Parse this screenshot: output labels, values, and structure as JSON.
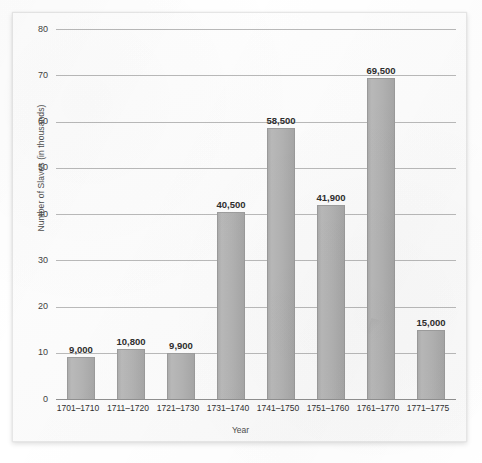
{
  "chart_data": {
    "type": "bar",
    "title": "",
    "xlabel": "Year",
    "ylabel": "Number of Slaves (in thousands)",
    "ylim": [
      0,
      80
    ],
    "ytick_labels": [
      "80",
      "70",
      "60",
      "50",
      "40",
      "30",
      "20",
      "10",
      "0"
    ],
    "ytick_values": [
      80,
      70,
      60,
      50,
      40,
      30,
      20,
      10,
      0
    ],
    "grid": true,
    "legend": "none",
    "categories": [
      "1701–1710",
      "1711–1720",
      "1721–1730",
      "1731–1740",
      "1741–1750",
      "1751–1760",
      "1761–1770",
      "1771–1775"
    ],
    "values": [
      9.0,
      10.8,
      9.9,
      40.5,
      58.5,
      41.9,
      69.5,
      15.0
    ],
    "value_labels": [
      "9,000",
      "10,800",
      "9,900",
      "40,500",
      "58,500",
      "41,900",
      "69,500",
      "15,000"
    ],
    "bars": [
      {
        "category": "1701–1710",
        "value": 9.0,
        "label": "9,000"
      },
      {
        "category": "1711–1720",
        "value": 10.8,
        "label": "10,800"
      },
      {
        "category": "1721–1730",
        "value": 9.9,
        "label": "9,900"
      },
      {
        "category": "1731–1740",
        "value": 40.5,
        "label": "40,500"
      },
      {
        "category": "1741–1750",
        "value": 58.5,
        "label": "58,500"
      },
      {
        "category": "1751–1760",
        "value": 41.9,
        "label": "41,900"
      },
      {
        "category": "1761–1770",
        "value": 69.5,
        "label": "69,500"
      },
      {
        "category": "1771–1775",
        "value": 15.0,
        "label": "15,000"
      }
    ],
    "colors": {
      "bar_fill": "#b2b2b2",
      "bar_edge": "#9a9a9a",
      "gridline": "#b9b9b9",
      "axis": "#8f8f8f",
      "label_text": "#2e2e2e",
      "tick_text": "#3f3f3f",
      "card_background": "#fdfdfd",
      "page_background": "#ffffff"
    }
  }
}
